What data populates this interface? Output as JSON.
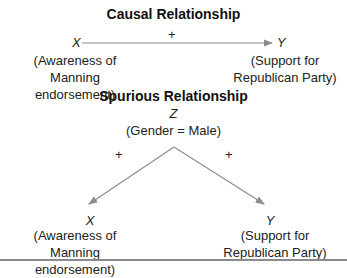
{
  "causal": {
    "title": "Causal Relationship",
    "x_var": "X",
    "y_var": "Y",
    "sign": "+",
    "x_label_1": "(Awareness of Manning",
    "x_label_2": "endorsement)",
    "y_label_1": "(Support for",
    "y_label_2": "Republican Party)"
  },
  "spurious": {
    "title": "Spurious Relationship",
    "z_var": "Z",
    "z_label": "(Gender = Male)",
    "left_sign": "+",
    "right_sign": "+",
    "x_var": "X",
    "y_var": "Y",
    "x_label_1": "(Awareness of Manning",
    "x_label_2": "endorsement)",
    "y_label_1": "(Support for",
    "y_label_2": "Republican Party)"
  },
  "colors": {
    "arrow": "#8c8c8c",
    "text": "#222222",
    "rule": "#8a8a8a"
  }
}
